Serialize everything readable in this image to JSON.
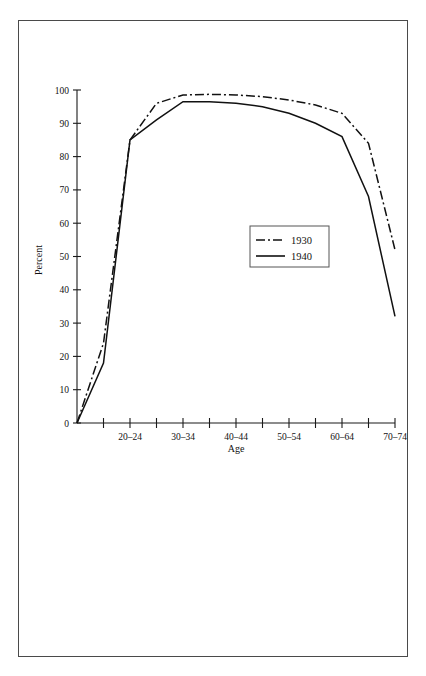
{
  "figure": {
    "frame_border_color": "#4a4a4a",
    "background_color": "#ffffff",
    "ink_color": "#111111"
  },
  "chart_data": {
    "type": "line",
    "title": "",
    "subtitle": "",
    "xlabel": "Age",
    "ylabel": "Percent",
    "grid": false,
    "legend_position": "center-right",
    "ylim": [
      0,
      100
    ],
    "ytick_labels": [
      "0",
      "10",
      "20",
      "30",
      "40",
      "50",
      "60",
      "70",
      "80",
      "90",
      "100"
    ],
    "ytick_values": [
      0,
      10,
      20,
      30,
      40,
      50,
      60,
      70,
      80,
      90,
      100
    ],
    "categories": [
      "10-14",
      "15-19",
      "20-24",
      "25-29",
      "30-34",
      "35-39",
      "40-44",
      "45-49",
      "50-54",
      "55-59",
      "60-64",
      "65-69",
      "70-74"
    ],
    "xtick_labels": [
      "",
      "",
      "20–24",
      "",
      "30–34",
      "",
      "40–44",
      "",
      "50–54",
      "",
      "60–64",
      "",
      "70–74"
    ],
    "series": [
      {
        "name": "1930",
        "style": "dash-dot",
        "values": [
          0,
          24,
          85,
          96,
          98.5,
          98.7,
          98.5,
          98,
          97,
          95.5,
          93,
          84,
          52
        ]
      },
      {
        "name": "1940",
        "style": "solid",
        "values": [
          0,
          18,
          85,
          91,
          96.5,
          96.5,
          96,
          95,
          93,
          90,
          86,
          68,
          32
        ]
      }
    ],
    "legend_entries": [
      {
        "label": "1930",
        "style": "dash-dot"
      },
      {
        "label": "1940",
        "style": "solid"
      }
    ]
  },
  "legend": {
    "entry_1_label": "1930",
    "entry_2_label": "1940"
  },
  "axes": {
    "x_title": "Age",
    "y_title": "Percent"
  }
}
